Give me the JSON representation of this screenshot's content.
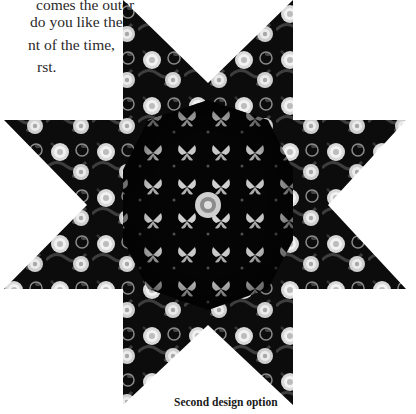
{
  "document": {
    "body_text_lines": [
      {
        "text": "comes the outer",
        "left": 36,
        "top": -5
      },
      {
        "text": "do you like the",
        "left": 30,
        "top": 12
      },
      {
        "text": "nt of the time,",
        "left": 28,
        "top": 35
      },
      {
        "text": "rst.",
        "left": 37,
        "top": 57
      }
    ],
    "figure": {
      "type": "eight-point star quilt block",
      "outer_fabric": "black floral with white roses",
      "center_fabric": "black with white butterflies, kaleidoscope",
      "colors": {
        "background": "#ffffff",
        "fabric_dark": "#0a0a0a",
        "fabric_mid": "#3a3a3a",
        "flower_light": "#e6e6e6",
        "flower_mid": "#bdbdbd"
      }
    },
    "caption": "Second design option"
  }
}
